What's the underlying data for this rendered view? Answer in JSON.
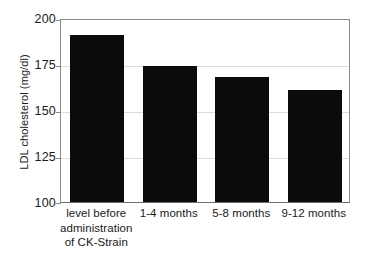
{
  "chart_data": {
    "type": "bar",
    "title": "",
    "subtitle": "",
    "xlabel": "",
    "ylabel": "LDL cholesterol (mg/dl)",
    "categories": [
      "level before administration of CK-Strain",
      "1-4 months",
      "5-8 months",
      "9-12 months"
    ],
    "category_lines": [
      [
        "level before",
        "administration",
        "of CK-Strain"
      ],
      [
        "1-4 months"
      ],
      [
        "5-8 months"
      ],
      [
        "9-12 months"
      ]
    ],
    "values": [
      191,
      174,
      168,
      161
    ],
    "ylim": [
      100,
      200
    ],
    "yticks": [
      100,
      125,
      150,
      175,
      200
    ],
    "ytick_labels": [
      "100",
      "125",
      "150",
      "175",
      "200"
    ],
    "grid": "single horizontal gridline at 150",
    "legend": "none",
    "bar_color": "#0b0b0b",
    "axis_color": "#8a8a8a",
    "gridline_color": "#dcdcdc",
    "background_color": "#ffffff",
    "units": "mg/dl"
  },
  "axis": {
    "y_title": "LDL cholesterol (mg/dl)"
  }
}
